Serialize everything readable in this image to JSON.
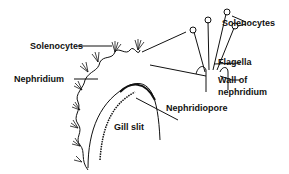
{
  "diagram": {
    "labels": {
      "solenocytes_left": "Solenocytes",
      "nephridium": "Nephridium",
      "solenocytes_right": "Solenocytes",
      "flagella": "Flagella",
      "wall_of_nephridium_line1": "Wall of",
      "wall_of_nephridium_line2": "nephridium",
      "nephridiopore": "Nephridiopore",
      "gill_slit": "Gill slit"
    },
    "colors": {
      "ink": "#111111",
      "background": "#ffffff"
    }
  }
}
